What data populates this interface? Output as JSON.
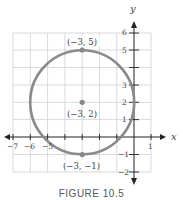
{
  "figure": {
    "caption": "FIGURE 10.5",
    "x_axis_label": "x",
    "y_axis_label": "y",
    "x_ticks": [
      "−7",
      "−6",
      "−5",
      "1"
    ],
    "y_ticks": [
      "6",
      "5",
      "3",
      "2",
      "1",
      "−1",
      "−2"
    ],
    "points": [
      {
        "label": "(−3, 5)",
        "x": -3,
        "y": 5
      },
      {
        "label": "(−3, 2)",
        "x": -3,
        "y": 2
      },
      {
        "label": "(−3, −1)",
        "x": -3,
        "y": -1
      }
    ],
    "circle": {
      "center": [
        -3,
        2
      ],
      "radius": 3
    },
    "colors": {
      "circle": "#8a8a8a",
      "grid": "#cfcfcf",
      "axis": "#222222"
    }
  }
}
